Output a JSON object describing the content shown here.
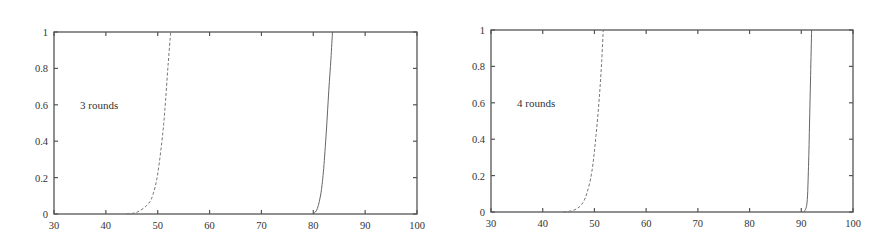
{
  "chart_data": [
    {
      "type": "line",
      "title": "",
      "annotation": "3 rounds",
      "xlabel": "",
      "ylabel": "",
      "xlim": [
        30,
        100
      ],
      "ylim": [
        0,
        1
      ],
      "x_ticks": [
        "30",
        "40",
        "50",
        "60",
        "70",
        "80",
        "90",
        "100"
      ],
      "y_ticks": [
        "0",
        "0.2",
        "0.4",
        "0.6",
        "0.8",
        "1"
      ],
      "grid": false,
      "legend": null,
      "series": [
        {
          "name": "dashed",
          "style": "dashed",
          "x": [
            44,
            46,
            48,
            49,
            50,
            51,
            51.5,
            52,
            52.5
          ],
          "y": [
            0,
            0.01,
            0.05,
            0.1,
            0.22,
            0.45,
            0.62,
            0.82,
            1.0
          ]
        },
        {
          "name": "solid",
          "style": "solid",
          "x": [
            80,
            80.8,
            81.5,
            82,
            82.5,
            83,
            83.4,
            83.7
          ],
          "y": [
            0,
            0.03,
            0.12,
            0.25,
            0.45,
            0.68,
            0.85,
            1.0
          ]
        }
      ]
    },
    {
      "type": "line",
      "title": "",
      "annotation": "4 rounds",
      "xlabel": "",
      "ylabel": "",
      "xlim": [
        30,
        100
      ],
      "ylim": [
        0,
        1
      ],
      "x_ticks": [
        "30",
        "40",
        "50",
        "60",
        "70",
        "80",
        "90",
        "100"
      ],
      "y_ticks": [
        "0",
        "0.2",
        "0.4",
        "0.6",
        "0.8",
        "1"
      ],
      "grid": false,
      "legend": null,
      "series": [
        {
          "name": "dashed",
          "style": "dashed",
          "x": [
            44,
            46,
            47.5,
            48.5,
            49.5,
            50.3,
            51,
            51.4,
            51.7
          ],
          "y": [
            0,
            0.01,
            0.04,
            0.1,
            0.22,
            0.42,
            0.65,
            0.83,
            1.0
          ]
        },
        {
          "name": "solid",
          "style": "solid",
          "x": [
            90.5,
            91.1,
            91.4,
            91.6,
            91.8,
            92.0
          ],
          "y": [
            0,
            0.05,
            0.25,
            0.5,
            0.75,
            1.0
          ]
        }
      ]
    }
  ]
}
